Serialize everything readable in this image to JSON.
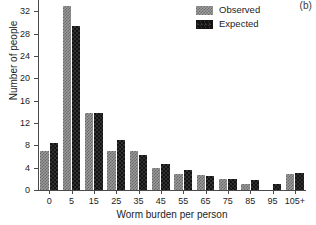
{
  "panel": {
    "label": "(b)"
  },
  "legend": {
    "position": "top-right",
    "entries": [
      {
        "label": "Observed",
        "swatch": "gray-checker-swatch",
        "color": "#9a9a9a"
      },
      {
        "label": "Expected",
        "swatch": "black-solid-swatch",
        "color": "#131313"
      }
    ]
  },
  "chart_data": {
    "type": "bar",
    "title": "",
    "subtitle": "",
    "xlabel": "Worm burden per person",
    "ylabel": "Number of people",
    "categories": [
      "0",
      "5",
      "15",
      "25",
      "35",
      "45",
      "55",
      "65",
      "75",
      "85",
      "95",
      "105+"
    ],
    "series": [
      {
        "name": "Observed",
        "color": "#9a9a9a",
        "values": [
          7,
          33,
          13.8,
          7,
          7,
          4,
          2.8,
          2.7,
          2,
          1,
          0,
          2.9
        ]
      },
      {
        "name": "Expected",
        "color": "#131313",
        "values": [
          8.4,
          29.3,
          13.8,
          9,
          6.3,
          4.6,
          3.5,
          2.5,
          2,
          1.8,
          1,
          3
        ]
      }
    ],
    "ylim": [
      0,
      34
    ],
    "yticks": [
      0,
      4,
      8,
      12,
      16,
      20,
      24,
      28,
      32
    ],
    "ytick_labels": [
      "0",
      "4",
      "8",
      "12",
      "16",
      "20",
      "24",
      "28",
      "32"
    ],
    "grid": false,
    "legend_position": "top-right"
  }
}
